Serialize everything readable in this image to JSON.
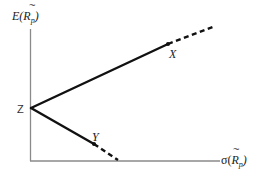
{
  "diagram": {
    "type": "risk-return-diagram",
    "axes": {
      "y_label": {
        "prefix": "E(",
        "var": "R",
        "tilde": "~",
        "sub": "p",
        "suffix": ")"
      },
      "x_label": {
        "prefix": "σ(",
        "var": "R",
        "tilde": "~",
        "sub": "p",
        "suffix": ")"
      }
    },
    "points": {
      "Z": {
        "label": "Z"
      },
      "X": {
        "label": "X"
      },
      "Y": {
        "label": "Y"
      }
    },
    "segments": [
      {
        "from": "Z",
        "to": "X",
        "style": "solid"
      },
      {
        "from": "X",
        "to": "beyond",
        "style": "dashed"
      },
      {
        "from": "Z",
        "to": "Y",
        "style": "solid"
      },
      {
        "from": "Y",
        "to": "x-axis",
        "style": "dashed"
      }
    ],
    "colors": {
      "line": "#111111",
      "axis": "#8a8a8a",
      "text": "#222222"
    }
  }
}
